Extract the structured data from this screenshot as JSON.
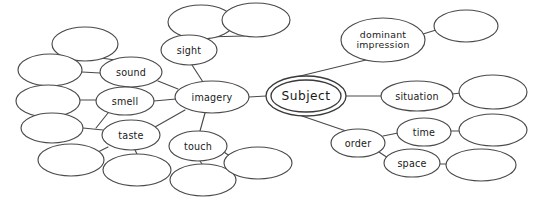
{
  "diagram": {
    "type": "mind-map",
    "background_color": "#ffffff",
    "stroke_color": "#4a4a4a",
    "text_color": "#1a1a1a",
    "center": {
      "id": "subject",
      "label": "Subject",
      "cx": 306,
      "cy": 96,
      "rx": 40,
      "ry": 20,
      "double_border": true
    },
    "nodes": [
      {
        "id": "imagery",
        "label": "imagery",
        "cx": 212,
        "cy": 97,
        "rx": 37,
        "ry": 16,
        "lines": 1
      },
      {
        "id": "sight",
        "label": "sight",
        "cx": 189,
        "cy": 50,
        "rx": 28,
        "ry": 15,
        "lines": 1
      },
      {
        "id": "sound",
        "label": "sound",
        "cx": 131,
        "cy": 72,
        "rx": 31,
        "ry": 15,
        "lines": 1
      },
      {
        "id": "smell",
        "label": "smell",
        "cx": 125,
        "cy": 101,
        "rx": 29,
        "ry": 14,
        "lines": 1
      },
      {
        "id": "taste",
        "label": "taste",
        "cx": 131,
        "cy": 135,
        "rx": 29,
        "ry": 15,
        "lines": 1
      },
      {
        "id": "touch",
        "label": "touch",
        "cx": 198,
        "cy": 146,
        "rx": 29,
        "ry": 15,
        "lines": 1
      },
      {
        "id": "dominant_impression",
        "label": "dominant impression",
        "line1": "dominant",
        "line2": "impression",
        "cx": 383,
        "cy": 40,
        "rx": 42,
        "ry": 22,
        "lines": 2
      },
      {
        "id": "situation",
        "label": "situation",
        "cx": 417,
        "cy": 96,
        "rx": 36,
        "ry": 15,
        "lines": 1
      },
      {
        "id": "order",
        "label": "order",
        "cx": 358,
        "cy": 143,
        "rx": 27,
        "ry": 14,
        "lines": 1
      },
      {
        "id": "time",
        "label": "time",
        "cx": 424,
        "cy": 132,
        "rx": 27,
        "ry": 14,
        "lines": 1
      },
      {
        "id": "space",
        "label": "space",
        "cx": 412,
        "cy": 163,
        "rx": 28,
        "ry": 14,
        "lines": 1
      }
    ],
    "blank_nodes": [
      {
        "id": "blank-sight-1",
        "cx": 201,
        "cy": 22,
        "rx": 33,
        "ry": 17
      },
      {
        "id": "blank-sight-2",
        "cx": 256,
        "cy": 20,
        "rx": 34,
        "ry": 17
      },
      {
        "id": "blank-sound-1",
        "cx": 85,
        "cy": 44,
        "rx": 33,
        "ry": 17
      },
      {
        "id": "blank-sound-2",
        "cx": 50,
        "cy": 70,
        "rx": 32,
        "ry": 16
      },
      {
        "id": "blank-smell-1",
        "cx": 48,
        "cy": 101,
        "rx": 32,
        "ry": 16
      },
      {
        "id": "blank-taste-1",
        "cx": 52,
        "cy": 128,
        "rx": 31,
        "ry": 15
      },
      {
        "id": "blank-taste-2",
        "cx": 71,
        "cy": 160,
        "rx": 33,
        "ry": 16
      },
      {
        "id": "blank-taste-3",
        "cx": 137,
        "cy": 170,
        "rx": 34,
        "ry": 16
      },
      {
        "id": "blank-touch-1",
        "cx": 203,
        "cy": 180,
        "rx": 33,
        "ry": 16
      },
      {
        "id": "blank-touch-2",
        "cx": 258,
        "cy": 163,
        "rx": 34,
        "ry": 16
      },
      {
        "id": "blank-di-1",
        "cx": 466,
        "cy": 26,
        "rx": 32,
        "ry": 16
      },
      {
        "id": "blank-situation-1",
        "cx": 493,
        "cy": 92,
        "rx": 34,
        "ry": 17
      },
      {
        "id": "blank-time-1",
        "cx": 493,
        "cy": 130,
        "rx": 34,
        "ry": 16
      },
      {
        "id": "blank-space-1",
        "cx": 481,
        "cy": 165,
        "rx": 35,
        "ry": 16
      }
    ],
    "edges": [
      {
        "id": "edge-subject-imagery",
        "from": "subject",
        "to": "imagery",
        "x1": 266,
        "y1": 96,
        "x2": 249,
        "y2": 97
      },
      {
        "id": "edge-subject-dominant",
        "from": "subject",
        "to": "dominant_impression",
        "x1": 296,
        "y1": 77,
        "x2": 366,
        "y2": 60
      },
      {
        "id": "edge-subject-situation",
        "from": "subject",
        "to": "situation",
        "x1": 346,
        "y1": 96,
        "x2": 381,
        "y2": 96
      },
      {
        "id": "edge-subject-order",
        "from": "subject",
        "to": "order",
        "x1": 302,
        "y1": 116,
        "x2": 346,
        "y2": 131
      },
      {
        "id": "edge-imagery-sight",
        "from": "imagery",
        "to": "sight",
        "x1": 203,
        "y1": 82,
        "x2": 192,
        "y2": 65
      },
      {
        "id": "edge-imagery-sound",
        "from": "imagery",
        "to": "sound",
        "x1": 178,
        "y1": 89,
        "x2": 158,
        "y2": 81
      },
      {
        "id": "edge-imagery-smell",
        "from": "imagery",
        "to": "smell",
        "x1": 176,
        "y1": 99,
        "x2": 154,
        "y2": 101
      },
      {
        "id": "edge-imagery-taste",
        "from": "imagery",
        "to": "taste",
        "x1": 185,
        "y1": 110,
        "x2": 155,
        "y2": 127
      },
      {
        "id": "edge-imagery-touch",
        "from": "imagery",
        "to": "touch",
        "x1": 205,
        "y1": 113,
        "x2": 200,
        "y2": 131
      },
      {
        "id": "edge-sight-blank1",
        "from": "sight",
        "to": "blank-sight-1",
        "x1": 183,
        "y1": 36,
        "x2": 196,
        "y2": 39
      },
      {
        "id": "edge-sight-blank2",
        "from": "sight",
        "to": "blank-sight-2",
        "x1": 204,
        "y1": 37,
        "x2": 245,
        "y2": 36
      },
      {
        "id": "edge-sound-blank1",
        "from": "sound",
        "to": "blank-sound-1",
        "x1": 115,
        "y1": 60,
        "x2": 101,
        "y2": 58
      },
      {
        "id": "edge-sound-blank2",
        "from": "sound",
        "to": "blank-sound-2",
        "x1": 100,
        "y1": 73,
        "x2": 82,
        "y2": 72
      },
      {
        "id": "edge-smell-blank1",
        "from": "smell",
        "to": "blank-smell-1",
        "x1": 96,
        "y1": 100,
        "x2": 80,
        "y2": 100
      },
      {
        "id": "edge-smell-taste",
        "from": "smell",
        "to": "taste",
        "x1": 108,
        "y1": 113,
        "x2": 96,
        "y2": 128
      },
      {
        "id": "edge-taste-blank1",
        "from": "taste",
        "to": "blank-taste-1",
        "x1": 103,
        "y1": 130,
        "x2": 83,
        "y2": 128
      },
      {
        "id": "edge-taste-blank2",
        "from": "taste",
        "to": "blank-taste-2",
        "x1": 108,
        "y1": 147,
        "x2": 96,
        "y2": 153
      },
      {
        "id": "edge-taste-blank3",
        "from": "taste",
        "to": "blank-taste-3",
        "x1": 135,
        "y1": 150,
        "x2": 137,
        "y2": 154
      },
      {
        "id": "edge-touch-blank1",
        "from": "touch",
        "to": "blank-touch-1",
        "x1": 200,
        "y1": 161,
        "x2": 202,
        "y2": 164
      },
      {
        "id": "edge-touch-blank2",
        "from": "touch",
        "to": "blank-touch-2",
        "x1": 224,
        "y1": 152,
        "x2": 231,
        "y2": 157
      },
      {
        "id": "edge-dominant-blank1",
        "from": "dominant_impression",
        "to": "blank-di-1",
        "x1": 423,
        "y1": 34,
        "x2": 436,
        "y2": 30
      },
      {
        "id": "edge-situation-blank1",
        "from": "situation",
        "to": "blank-situation-1",
        "x1": 452,
        "y1": 94,
        "x2": 461,
        "y2": 93
      },
      {
        "id": "edge-order-time",
        "from": "order",
        "to": "time",
        "x1": 383,
        "y1": 136,
        "x2": 398,
        "y2": 133
      },
      {
        "id": "edge-order-space",
        "from": "order",
        "to": "space",
        "x1": 379,
        "y1": 152,
        "x2": 388,
        "y2": 158
      },
      {
        "id": "edge-time-blank1",
        "from": "time",
        "to": "blank-time-1",
        "x1": 451,
        "y1": 131,
        "x2": 460,
        "y2": 131
      },
      {
        "id": "edge-space-blank1",
        "from": "space",
        "to": "blank-space-1",
        "x1": 440,
        "y1": 164,
        "x2": 447,
        "y2": 164
      }
    ]
  }
}
